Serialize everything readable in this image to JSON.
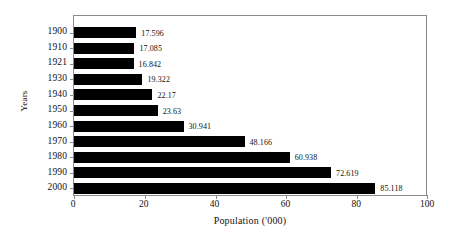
{
  "chart_data": {
    "type": "bar",
    "orientation": "horizontal",
    "title": "",
    "xlabel": "Population ('000)",
    "ylabel": "Years",
    "categories": [
      "1900",
      "1910",
      "1921",
      "1930",
      "1940",
      "1950",
      "1960",
      "1970",
      "1980",
      "1990",
      "2000"
    ],
    "values": [
      17.596,
      17.085,
      16.842,
      19.322,
      22.17,
      23.63,
      30.941,
      48.166,
      60.938,
      72.619,
      85.118
    ],
    "value_labels": [
      "17.596",
      "17.085",
      "16.842",
      "19.322",
      "22.17",
      "23.63",
      "30.941",
      "48.166",
      "60.938",
      "72.619",
      "85.118"
    ],
    "xlim": [
      0,
      100
    ],
    "xticks": [
      0,
      20,
      40,
      60,
      80,
      100
    ],
    "xtick_labels": [
      "0",
      "20",
      "40",
      "60",
      "80",
      "100"
    ],
    "grid": false,
    "legend": false,
    "bar_color": "#000000",
    "frame_color": "#8a8a8a",
    "background": "#ffffff"
  }
}
